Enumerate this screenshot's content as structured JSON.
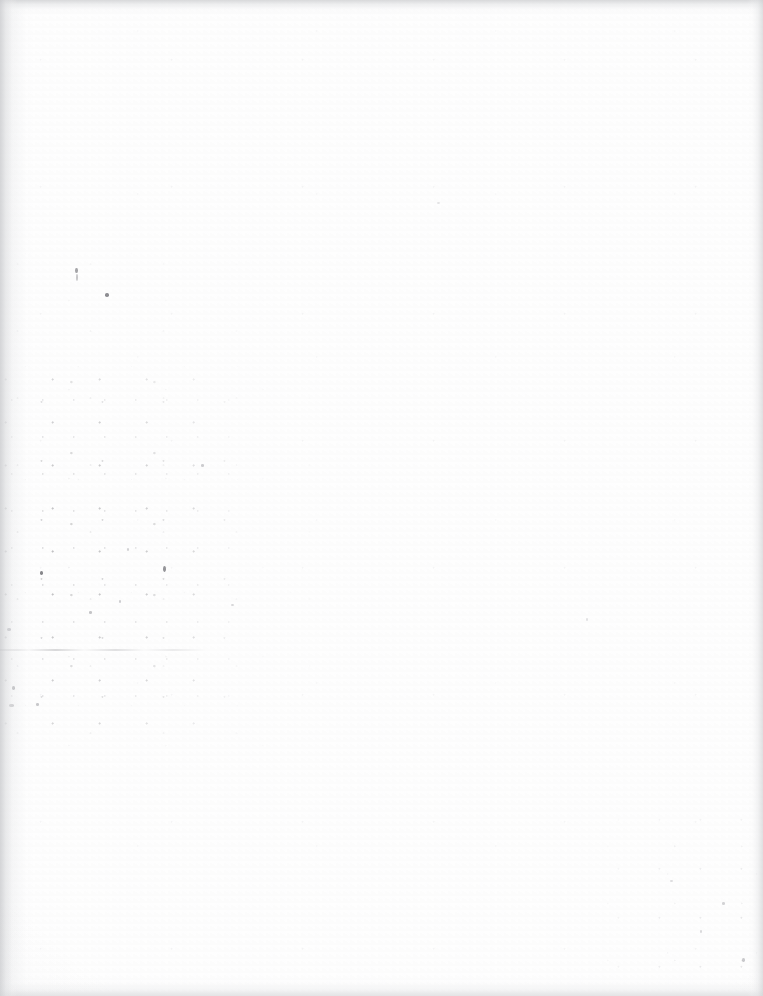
{
  "page": {
    "kind": "scanned-blank-page",
    "width": 763,
    "height": 996,
    "paper_color": "#fefefe",
    "background_color": "#ffffff",
    "text_content": "",
    "visible_text": []
  },
  "artifacts": {
    "scan_edges": {
      "color": "#cdced0",
      "top_height": 16,
      "bottom_height": 20,
      "left_width": 18,
      "right_width": 16
    },
    "gutter_shadow": {
      "edge": "left",
      "width": 34,
      "color": "#d6d7d9"
    },
    "smudge_line": {
      "x": 0,
      "y": 649,
      "width": 206,
      "color": "#96969a"
    },
    "noise_regions": [
      {
        "name": "left-middle-cluster",
        "x": 0,
        "y": 370,
        "width": 235,
        "height": 360,
        "density": "heavy",
        "color": "#84848 8"
      },
      {
        "name": "left-halo",
        "x": 0,
        "y": 240,
        "width": 330,
        "height": 520,
        "density": "medium",
        "color": "#9e9ea2"
      },
      {
        "name": "bottom-right-corner",
        "x": 593,
        "y": 806,
        "width": 170,
        "height": 190,
        "density": "light",
        "color": "#9b9b9f"
      },
      {
        "name": "global-dust",
        "x": 0,
        "y": 0,
        "width": 763,
        "height": 996,
        "density": "sparse",
        "color": "#aaaaae"
      }
    ],
    "specks": [
      {
        "x": 75,
        "y": 268,
        "w": 3,
        "h": 5,
        "color": "#6e6e72",
        "opacity": 0.62
      },
      {
        "x": 76,
        "y": 274,
        "w": 2,
        "h": 7,
        "color": "#85858a",
        "opacity": 0.45
      },
      {
        "x": 105,
        "y": 293,
        "w": 4,
        "h": 4,
        "color": "#5d5d62",
        "opacity": 0.7
      },
      {
        "x": 40,
        "y": 571,
        "w": 3,
        "h": 4,
        "color": "#5a5a5f",
        "opacity": 0.72
      },
      {
        "x": 163,
        "y": 566,
        "w": 3,
        "h": 6,
        "color": "#636368",
        "opacity": 0.68
      },
      {
        "x": 7,
        "y": 628,
        "w": 4,
        "h": 3,
        "color": "#777780",
        "opacity": 0.55
      },
      {
        "x": 12,
        "y": 686,
        "w": 3,
        "h": 4,
        "color": "#6f6f75",
        "opacity": 0.58
      },
      {
        "x": 9,
        "y": 704,
        "w": 5,
        "h": 3,
        "color": "#7b7b81",
        "opacity": 0.5
      },
      {
        "x": 36,
        "y": 703,
        "w": 3,
        "h": 3,
        "color": "#8a8a90",
        "opacity": 0.45
      },
      {
        "x": 89,
        "y": 611,
        "w": 3,
        "h": 3,
        "color": "#86868c",
        "opacity": 0.48
      },
      {
        "x": 119,
        "y": 600,
        "w": 2,
        "h": 3,
        "color": "#90909 6",
        "opacity": 0.42
      },
      {
        "x": 201,
        "y": 464,
        "w": 3,
        "h": 3,
        "color": "#8e8e94",
        "opacity": 0.44
      },
      {
        "x": 127,
        "y": 548,
        "w": 2,
        "h": 3,
        "color": "#96969c",
        "opacity": 0.4
      },
      {
        "x": 231,
        "y": 604,
        "w": 3,
        "h": 2,
        "color": "#9a9aa0",
        "opacity": 0.38
      },
      {
        "x": 742,
        "y": 958,
        "w": 3,
        "h": 4,
        "color": "#8c8c92",
        "opacity": 0.46
      },
      {
        "x": 722,
        "y": 902,
        "w": 3,
        "h": 3,
        "color": "#9393 99",
        "opacity": 0.4
      },
      {
        "x": 700,
        "y": 930,
        "w": 2,
        "h": 3,
        "color": "#9b9ba1",
        "opacity": 0.36
      },
      {
        "x": 670,
        "y": 880,
        "w": 3,
        "h": 2,
        "color": "#a0a0a6",
        "opacity": 0.34
      },
      {
        "x": 586,
        "y": 618,
        "w": 2,
        "h": 3,
        "color": "#a2a2a8",
        "opacity": 0.3
      },
      {
        "x": 437,
        "y": 202,
        "w": 3,
        "h": 2,
        "color": "#a4a4aa",
        "opacity": 0.28
      }
    ]
  }
}
